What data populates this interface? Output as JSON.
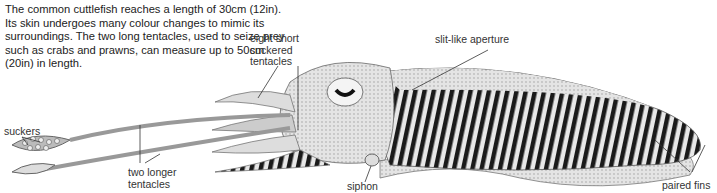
{
  "intro": "The common cuttlefish reaches a length of 30cm (12in). Its skin undergoes many colour changes to mimic its surroundings. The two long tentacles, used to seize prey such as crabs and prawns, can measure up to 50cm (20in) in length.",
  "labels": {
    "eight_short": "eight short suckered tentacles",
    "slit": "slit-like aperture",
    "suckers": "suckers",
    "two_longer": "two longer tentacles",
    "siphon": "siphon",
    "paired_fins": "paired fins"
  },
  "colors": {
    "ink": "#222222",
    "body_light": "#d8d8d8",
    "stripe": "#1a1a1a"
  }
}
